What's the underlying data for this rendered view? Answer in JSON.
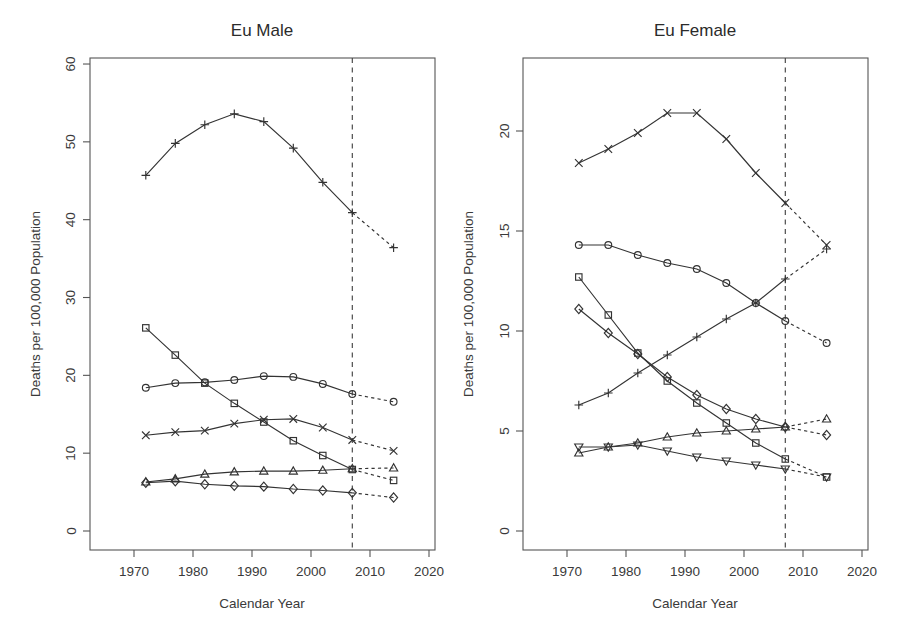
{
  "figure": {
    "width": 902,
    "height": 644,
    "background": "#ffffff",
    "line_color": "#333333",
    "axis_color": "#555555",
    "projection_divider_year": 2007
  },
  "chart_data": [
    {
      "type": "line",
      "panel": "left",
      "title": "Eu Male",
      "xlabel": "Calendar Year",
      "ylabel": "Deaths per 100,000 Population",
      "xlim": [
        1966,
        2023
      ],
      "ylim": [
        -1.5,
        62
      ],
      "xticks": [
        1970,
        1980,
        1990,
        2000,
        2010,
        2020
      ],
      "xticklabels": [
        "1970",
        "1980",
        "1990",
        "2000",
        "2010",
        "2020"
      ],
      "yticks": [
        0,
        10,
        20,
        30,
        40,
        50,
        60
      ],
      "yticklabels": [
        "0",
        "10",
        "20",
        "30",
        "40",
        "50",
        "60"
      ],
      "grid": false,
      "legend": "none",
      "annotations": [
        "vertical dashed line at 2007 separating observed (solid) from projected (dashed)"
      ],
      "x": [
        1972,
        1977,
        1982,
        1987,
        1992,
        1997,
        2002,
        2007,
        2014
      ],
      "projection_start_index": 7,
      "series": [
        {
          "name": "series-plus",
          "marker": "plus",
          "values": [
            45.7,
            49.8,
            52.2,
            53.6,
            52.6,
            49.2,
            44.8,
            40.9,
            36.4
          ]
        },
        {
          "name": "series-square",
          "marker": "square",
          "values": [
            26.1,
            22.6,
            19.0,
            16.4,
            14.0,
            11.6,
            9.7,
            7.9,
            6.5
          ]
        },
        {
          "name": "series-circle",
          "marker": "circle",
          "values": [
            18.4,
            19.0,
            19.1,
            19.4,
            19.9,
            19.8,
            18.9,
            17.6,
            16.6
          ]
        },
        {
          "name": "series-cross",
          "marker": "cross",
          "values": [
            12.3,
            12.7,
            12.9,
            13.8,
            14.3,
            14.4,
            13.3,
            11.7,
            10.3
          ]
        },
        {
          "name": "series-triangle",
          "marker": "triangle",
          "values": [
            6.3,
            6.7,
            7.3,
            7.6,
            7.7,
            7.7,
            7.8,
            8.0,
            8.1
          ]
        },
        {
          "name": "series-diamond",
          "marker": "diamond",
          "values": [
            6.2,
            6.4,
            6.0,
            5.8,
            5.7,
            5.4,
            5.2,
            4.9,
            4.3
          ]
        }
      ]
    },
    {
      "type": "line",
      "panel": "right",
      "title": "Eu Female",
      "xlabel": "Calendar Year",
      "ylabel": "Deaths per 100,000 Population",
      "xlim": [
        1966,
        2023
      ],
      "ylim": [
        -0.6,
        23.7
      ],
      "xticks": [
        1970,
        1980,
        1990,
        2000,
        2010,
        2020
      ],
      "xticklabels": [
        "1970",
        "1980",
        "1990",
        "2000",
        "2010",
        "2020"
      ],
      "yticks": [
        0,
        5,
        10,
        15,
        20
      ],
      "yticklabels": [
        "0",
        "5",
        "10",
        "15",
        "20"
      ],
      "grid": false,
      "legend": "none",
      "annotations": [
        "vertical dashed line at 2007 separating observed (solid) from projected (dashed)"
      ],
      "x": [
        1972,
        1977,
        1982,
        1987,
        1992,
        1997,
        2002,
        2007,
        2014
      ],
      "projection_start_index": 7,
      "series": [
        {
          "name": "series-cross",
          "marker": "cross",
          "values": [
            18.4,
            19.1,
            19.9,
            20.9,
            20.9,
            19.6,
            17.9,
            16.4,
            14.3
          ]
        },
        {
          "name": "series-circle",
          "marker": "circle",
          "values": [
            14.3,
            14.3,
            13.8,
            13.4,
            13.1,
            12.4,
            11.4,
            10.5,
            9.4
          ]
        },
        {
          "name": "series-square",
          "marker": "square",
          "values": [
            12.7,
            10.8,
            8.9,
            7.5,
            6.4,
            5.4,
            4.4,
            3.6,
            2.7
          ]
        },
        {
          "name": "series-diamond",
          "marker": "diamond",
          "values": [
            11.1,
            9.9,
            8.85,
            7.7,
            6.8,
            6.1,
            5.6,
            5.2,
            4.8
          ]
        },
        {
          "name": "series-plus",
          "marker": "plus",
          "values": [
            6.3,
            6.9,
            7.9,
            8.8,
            9.7,
            10.6,
            11.4,
            12.6,
            14.1
          ]
        },
        {
          "name": "series-triangle",
          "marker": "triangle",
          "values": [
            3.9,
            4.2,
            4.4,
            4.7,
            4.9,
            5.0,
            5.1,
            5.2,
            5.6
          ]
        },
        {
          "name": "series-triangle-down",
          "marker": "triangle-down",
          "values": [
            4.2,
            4.2,
            4.3,
            4.0,
            3.7,
            3.5,
            3.3,
            3.1,
            2.7
          ]
        }
      ]
    }
  ]
}
